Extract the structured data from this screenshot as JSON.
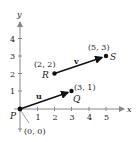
{
  "diagram": {
    "axes": {
      "x_label": "x",
      "y_label": "y",
      "x_ticks": [
        "1",
        "2",
        "3",
        "4",
        "5"
      ],
      "y_ticks": [
        "1",
        "2",
        "3",
        "4"
      ]
    },
    "points": {
      "P": {
        "name": "P",
        "coords": "(0, 0)"
      },
      "Q": {
        "name": "Q",
        "coords": "(3, 1)"
      },
      "R": {
        "name": "R",
        "coords": "(2, 2)"
      },
      "S": {
        "name": "S",
        "coords": "(5, 3)"
      }
    },
    "vectors": {
      "u": {
        "label": "u",
        "from": "P",
        "to": "Q"
      },
      "v": {
        "label": "v",
        "from": "R",
        "to": "S"
      }
    },
    "colors": {
      "ink": "#222222",
      "axis": "#888888"
    }
  }
}
